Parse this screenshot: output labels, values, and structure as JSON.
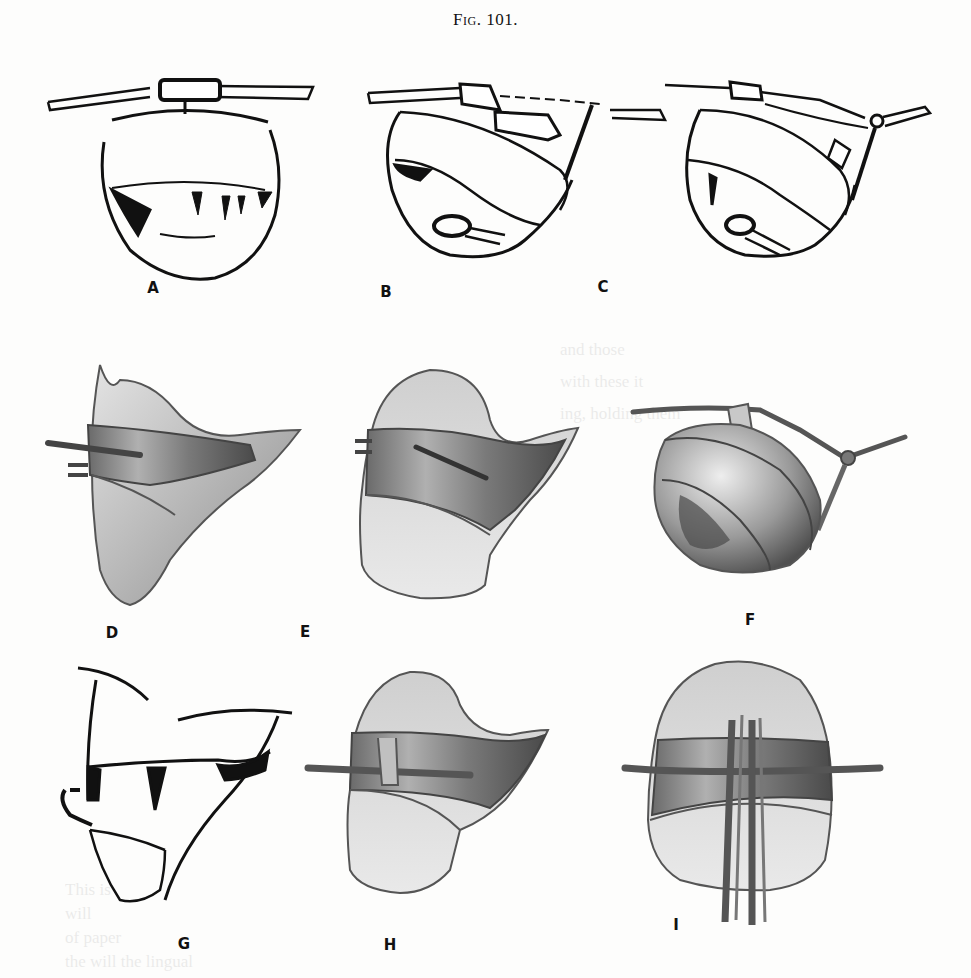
{
  "figure": {
    "title": "Fig. 101.",
    "panels": [
      {
        "id": "A",
        "label": "A",
        "style": "line-drawing",
        "subject": "bowl-shaped matrix band with top strap and clamp, front view"
      },
      {
        "id": "B",
        "label": "B",
        "style": "line-drawing",
        "subject": "matrix band tilted with tie strap, side view"
      },
      {
        "id": "C",
        "label": "C",
        "style": "line-drawing",
        "subject": "matrix band tilted with looped strap, side view"
      },
      {
        "id": "D",
        "label": "D",
        "style": "shaded",
        "subject": "tooth crown with band and pin, profile"
      },
      {
        "id": "E",
        "label": "E",
        "style": "shaded",
        "subject": "tooth crown with band and diagonal pin, front"
      },
      {
        "id": "F",
        "label": "F",
        "style": "shaded",
        "subject": "matrix on tooth with tied ligature"
      },
      {
        "id": "G",
        "label": "G",
        "style": "line-drawing",
        "subject": "tooth crown outline with band, profile"
      },
      {
        "id": "H",
        "label": "H",
        "style": "shaded",
        "subject": "tooth crown with horizontal wire and band"
      },
      {
        "id": "I",
        "label": "I",
        "style": "shaded",
        "subject": "tooth crown with horizontal wire and vertical ligature strips"
      }
    ]
  },
  "bleed_through": [
    "and those",
    "with these it",
    "ing, holding them",
    "This is",
    "will",
    "of paper",
    "the will the lingual"
  ],
  "colors": {
    "paper": "#fdfdfc",
    "ink": "#111111",
    "shade_light": "#d6d6d6",
    "shade_mid": "#9a9a9a",
    "shade_dark": "#555555"
  }
}
